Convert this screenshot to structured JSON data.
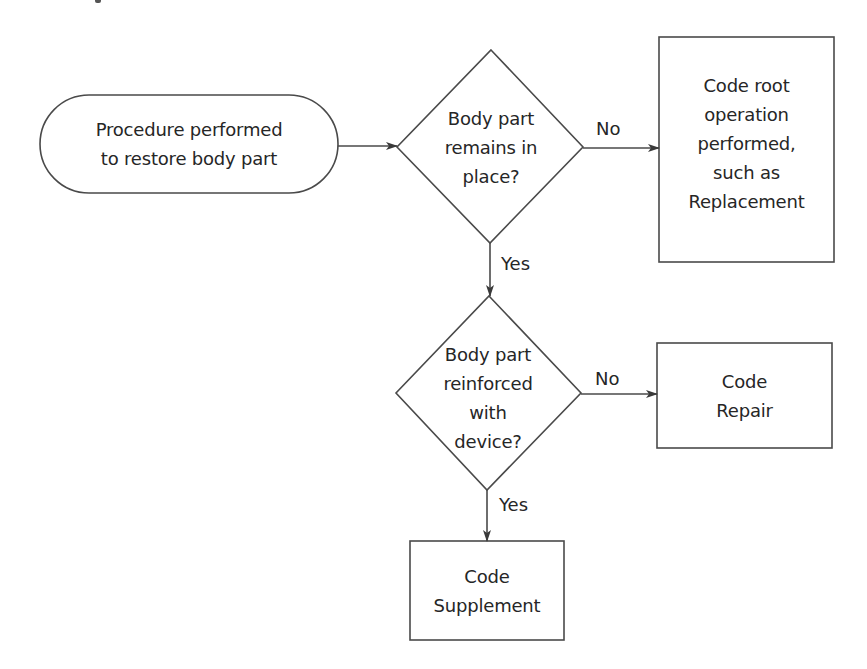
{
  "diagram": {
    "type": "flowchart",
    "cropped_top_text_fragment": true,
    "colors": {
      "background": "#ffffff",
      "stroke": "#4a4a4a",
      "text": "#262626"
    },
    "nodes": {
      "start": {
        "shape": "terminator",
        "lines": [
          "Procedure performed",
          "to restore body part"
        ]
      },
      "decision1": {
        "shape": "diamond",
        "lines": [
          "Body part",
          "remains in",
          "place?"
        ]
      },
      "replacement": {
        "shape": "rectangle",
        "lines": [
          "Code root",
          "operation",
          "performed,",
          "such as",
          "Replacement"
        ]
      },
      "decision2": {
        "shape": "diamond",
        "lines": [
          "Body part",
          "reinforced",
          "with",
          "device?"
        ]
      },
      "repair": {
        "shape": "rectangle",
        "lines": [
          "Code",
          "Repair"
        ]
      },
      "supplement": {
        "shape": "rectangle",
        "lines": [
          "Code",
          "Supplement"
        ]
      }
    },
    "edges": [
      {
        "from": "start",
        "to": "decision1",
        "label": ""
      },
      {
        "from": "decision1",
        "to": "replacement",
        "label": "No"
      },
      {
        "from": "decision1",
        "to": "decision2",
        "label": "Yes"
      },
      {
        "from": "decision2",
        "to": "repair",
        "label": "No"
      },
      {
        "from": "decision2",
        "to": "supplement",
        "label": "Yes"
      }
    ]
  }
}
